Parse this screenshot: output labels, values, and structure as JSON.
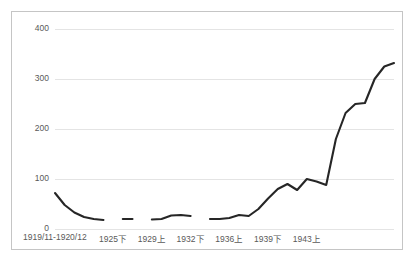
{
  "chart_data": {
    "type": "line",
    "title": "",
    "subtitle": "",
    "xlabel": "",
    "ylabel": "",
    "ylim": [
      0,
      400
    ],
    "yticks": [
      0,
      100,
      200,
      300,
      400
    ],
    "ytick_labels": [
      "0",
      "100",
      "200",
      "300",
      "400"
    ],
    "grid": true,
    "legend": false,
    "legend_position": "none",
    "xtick_labels": [
      "1919/11-1920/12",
      "1925下",
      "1929上",
      "1932下",
      "1936上",
      "1939下",
      "1943上"
    ],
    "xtick_indices": [
      0,
      6,
      10,
      14,
      18,
      22,
      26
    ],
    "series": [
      {
        "name": "series-1",
        "color": "#262626",
        "x": [
          0,
          1,
          2,
          3,
          4,
          5,
          6,
          7,
          8,
          9,
          10,
          11,
          12,
          13,
          14,
          15,
          16,
          17,
          18,
          19,
          20,
          21,
          22,
          23,
          24,
          25,
          26,
          27,
          28
        ],
        "values": [
          72,
          48,
          33,
          24,
          20,
          18,
          null,
          20,
          20,
          null,
          19,
          20,
          27,
          28,
          26,
          null,
          20,
          20,
          22,
          28,
          26,
          40,
          61,
          80,
          90,
          78,
          100,
          95,
          88
        ],
        "values_tail": [
          180,
          232,
          250,
          252,
          300,
          325,
          332
        ]
      }
    ],
    "points": [
      {
        "i": 0,
        "v": 72
      },
      {
        "i": 1,
        "v": 48
      },
      {
        "i": 2,
        "v": 33
      },
      {
        "i": 3,
        "v": 24
      },
      {
        "i": 4,
        "v": 20
      },
      {
        "i": 5,
        "v": 18
      },
      {
        "i": 6,
        "v": null
      },
      {
        "i": 7,
        "v": 20
      },
      {
        "i": 8,
        "v": 20
      },
      {
        "i": 9,
        "v": null
      },
      {
        "i": 10,
        "v": 19
      },
      {
        "i": 11,
        "v": 20
      },
      {
        "i": 12,
        "v": 27
      },
      {
        "i": 13,
        "v": 28
      },
      {
        "i": 14,
        "v": 26
      },
      {
        "i": 15,
        "v": null
      },
      {
        "i": 16,
        "v": 20
      },
      {
        "i": 17,
        "v": 20
      },
      {
        "i": 18,
        "v": 22
      },
      {
        "i": 19,
        "v": 28
      },
      {
        "i": 20,
        "v": 26
      },
      {
        "i": 21,
        "v": 40
      },
      {
        "i": 22,
        "v": 61
      },
      {
        "i": 23,
        "v": 80
      },
      {
        "i": 24,
        "v": 90
      },
      {
        "i": 25,
        "v": 78
      },
      {
        "i": 26,
        "v": 100
      },
      {
        "i": 27,
        "v": 95
      },
      {
        "i": 28,
        "v": 88
      },
      {
        "i": 29,
        "v": 180
      },
      {
        "i": 30,
        "v": 232
      },
      {
        "i": 31,
        "v": 250
      },
      {
        "i": 32,
        "v": 252
      },
      {
        "i": 33,
        "v": 300
      },
      {
        "i": 34,
        "v": 325
      },
      {
        "i": 35,
        "v": 332
      }
    ],
    "n_points": 36,
    "axis": {
      "x_min_index": 0,
      "x_max_index": 35,
      "y_min": 0,
      "y_max": 400
    },
    "colors": {
      "line": "#262626",
      "grid": "#e4e4e4",
      "border": "#c5c5c5",
      "tick_text": "#595959",
      "background": "#ffffff"
    }
  }
}
